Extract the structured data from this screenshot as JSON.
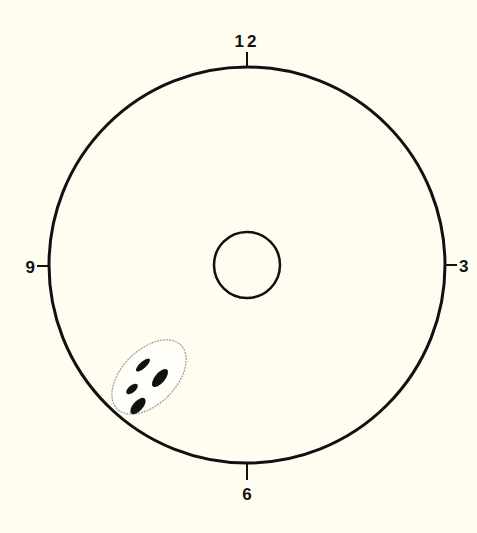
{
  "diagram": {
    "type": "clock-position-target",
    "background_color": "#fffdf0",
    "stroke_color": "#111111",
    "labels": {
      "top": "12",
      "right": "3",
      "bottom": "6",
      "left": "9"
    },
    "outer_circle": {
      "cx": 247,
      "cy": 265,
      "r": 199
    },
    "inner_circle": {
      "cx": 247,
      "cy": 265,
      "r": 33
    },
    "marked_region": {
      "description": "shaded elliptical cluster at approximately 7-8 o'clock position near outer rim",
      "mark_count": 4,
      "clock_position": "7-8 o'clock"
    }
  }
}
